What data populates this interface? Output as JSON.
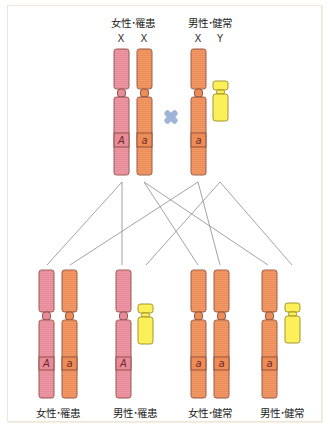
{
  "colors": {
    "x_affected": "#e88a9a",
    "x_normal": "#ee8c55",
    "y": "#fbf05a",
    "outline": "#8a4a3a",
    "y_outline": "#9a8a20",
    "cross": "#9fb4d8",
    "line": "#8c8c8c",
    "frame": "#efe6d6"
  },
  "parents": {
    "female": {
      "label": "女性･罹患",
      "chromosomes": [
        "X",
        "X"
      ],
      "alleles": [
        "A",
        "a"
      ]
    },
    "male": {
      "label": "男性･健常",
      "chromosomes": [
        "X",
        "Y"
      ],
      "alleles": [
        "a",
        ""
      ]
    },
    "cross_symbol": "✖"
  },
  "offspring": [
    {
      "label": "女性･罹患",
      "alleles": [
        "A",
        "a"
      ]
    },
    {
      "label": "男性･罹患",
      "alleles": [
        "A",
        ""
      ]
    },
    {
      "label": "女性･健常",
      "alleles": [
        "a",
        "a"
      ]
    },
    {
      "label": "男性･健常",
      "alleles": [
        "a",
        ""
      ]
    }
  ],
  "lines": [
    {
      "from": "female-A",
      "to": "offspring-1-X1"
    },
    {
      "from": "female-A",
      "to": "offspring-2-X"
    },
    {
      "from": "female-a",
      "to": "offspring-3-X1"
    },
    {
      "from": "female-a",
      "to": "offspring-4-X"
    },
    {
      "from": "male-X-a",
      "to": "offspring-1-X2"
    },
    {
      "from": "male-X-a",
      "to": "offspring-3-X2"
    },
    {
      "from": "male-Y",
      "to": "offspring-2-Y"
    },
    {
      "from": "male-Y",
      "to": "offspring-4-Y"
    }
  ]
}
